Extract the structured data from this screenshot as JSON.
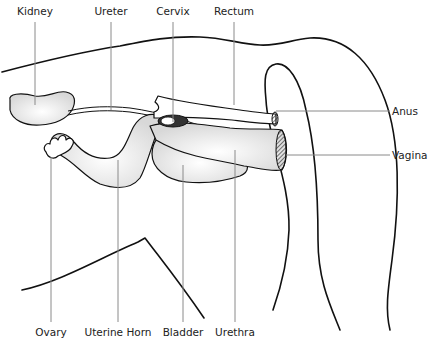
{
  "labels": {
    "kidney": "Kidney",
    "ureter": "Ureter",
    "cervix": "Cervix",
    "rectum": "Rectum",
    "anus": "Anus",
    "vagina": "Vagina",
    "ovary": "Ovary",
    "uterine_horn": "Uterine Horn",
    "bladder": "Bladder",
    "urethra": "Urethra"
  }
}
